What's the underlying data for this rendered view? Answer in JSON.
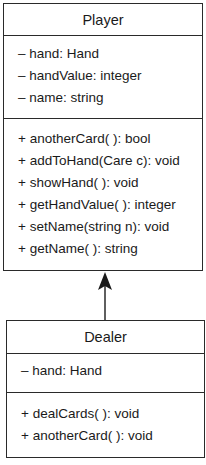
{
  "diagram": {
    "type": "uml-class-diagram",
    "classes": [
      {
        "name": "Player",
        "attributes": [
          "– hand: Hand",
          "– handValue: integer",
          "– name: string"
        ],
        "methods": [
          "+ anotherCard( ): bool",
          "+ addToHand(Care c): void",
          "+ showHand( ): void",
          "+ getHandValue( ): integer",
          "+ setName(string n): void",
          "+ getName( ): string"
        ]
      },
      {
        "name": "Dealer",
        "attributes": [
          "– hand: Hand"
        ],
        "methods": [
          "+ dealCards( ): void",
          "+ anotherCard( ): void"
        ]
      }
    ],
    "relationships": [
      {
        "type": "inheritance",
        "from": "Dealer",
        "to": "Player",
        "arrow": "filled-arrowhead"
      }
    ]
  },
  "colors": {
    "line": "#2a2a2a",
    "background": "#ffffff",
    "text": "#1a1a1a"
  }
}
